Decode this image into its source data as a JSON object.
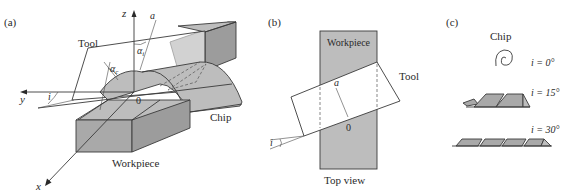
{
  "figure": {
    "panel_a": {
      "label": "(a)",
      "axis_z": "z",
      "axis_y": "y",
      "axis_x": "x",
      "line_a": "a",
      "angle_alpha_i": "αi",
      "angle_alpha_c": "αc",
      "angle_i": "i",
      "origin": "0",
      "tool_label": "Tool",
      "chip_label": "Chip",
      "workpiece_label": "Workpiece"
    },
    "panel_b": {
      "label": "(b)",
      "workpiece_label": "Workpiece",
      "tool_label": "Tool",
      "line_a": "a",
      "origin": "0",
      "angle_i": "i",
      "caption": "Top view"
    },
    "panel_c": {
      "label": "(c)",
      "chip_title": "Chip",
      "rows": [
        {
          "angle": "i = 0°",
          "shape": "spiral"
        },
        {
          "angle": "i = 15°",
          "shape": "helical-short"
        },
        {
          "angle": "i = 30°",
          "shape": "helical-long"
        }
      ]
    },
    "colors": {
      "fill_gray": "#a9a9a9",
      "stroke": "#3a3a3a",
      "background": "#ffffff"
    }
  }
}
